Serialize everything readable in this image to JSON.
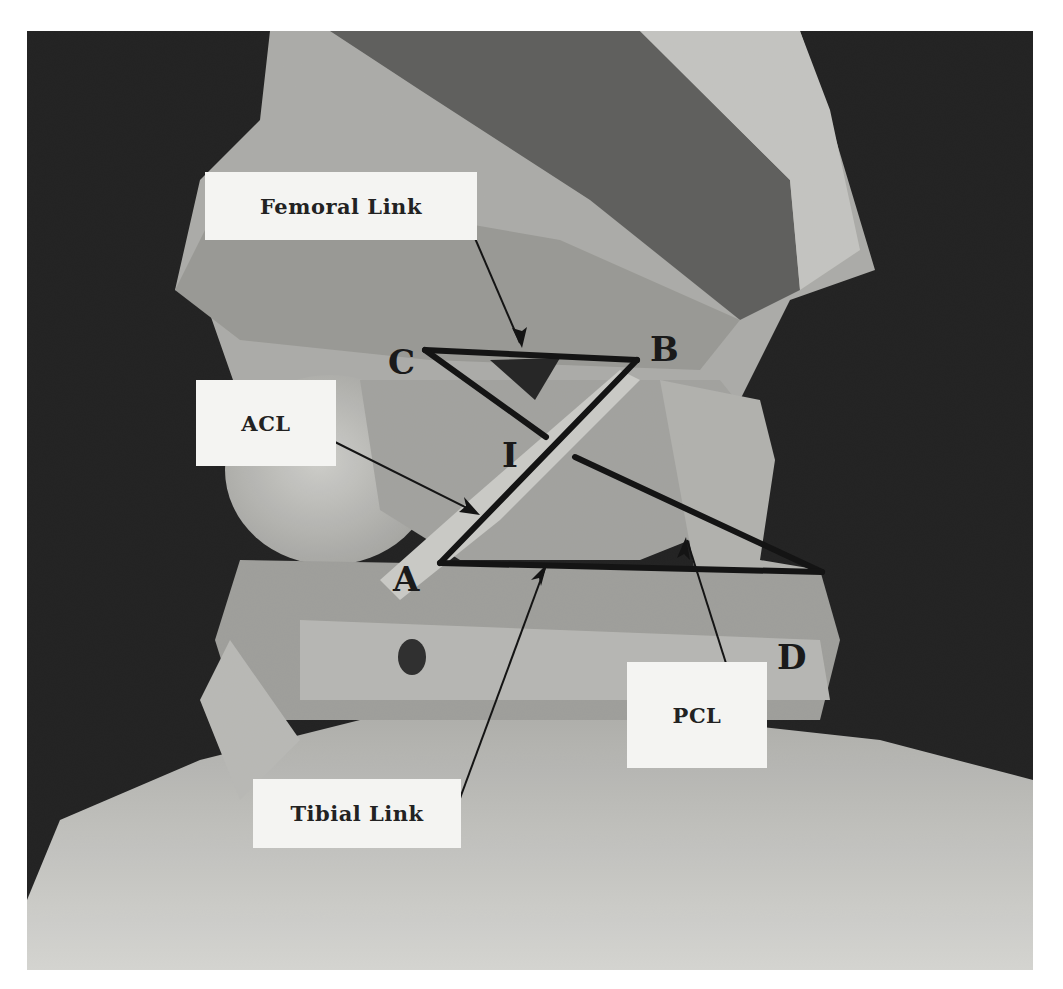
{
  "figure": {
    "colors": {
      "background_dark": "#1c1c1c",
      "tissue_light": "#c8c8c4",
      "tissue_mid": "#9a9a96",
      "muscle_dark": "#5e5e5c",
      "line": "#141414",
      "label_bg": "#f4f4f2"
    }
  },
  "labels": {
    "femoral_link": "Femoral Link",
    "acl": "ACL",
    "pcl": "PCL",
    "tibial_link": "Tibial Link"
  },
  "points": {
    "A": "A",
    "B": "B",
    "C": "C",
    "D": "D",
    "I": "I"
  },
  "geometry": {
    "A": [
      440,
      563
    ],
    "B": [
      637,
      360
    ],
    "C": [
      425,
      350
    ],
    "D": [
      822,
      572
    ],
    "I_label": [
      503,
      415
    ]
  }
}
